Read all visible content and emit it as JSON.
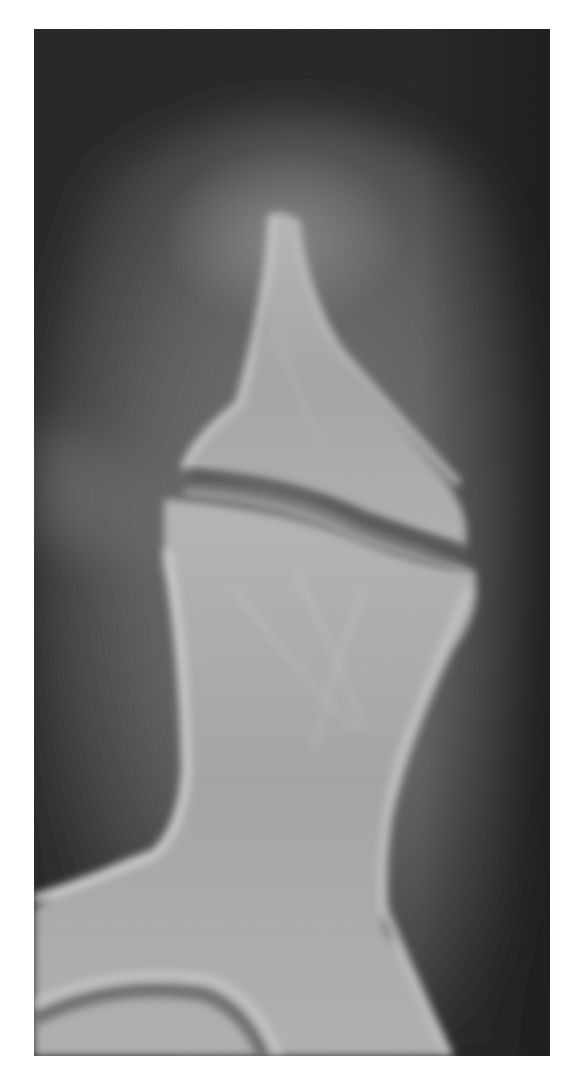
{
  "image": {
    "kind": "radiograph",
    "subject": "phalangeal bone and joint, lateral view",
    "background_color": "#ffffff",
    "plate_color": "#141414",
    "soft_tissue_color": "#5a5a5a",
    "bone_color": "#b4b4b4",
    "cortex_color": "#d2d2d2"
  }
}
